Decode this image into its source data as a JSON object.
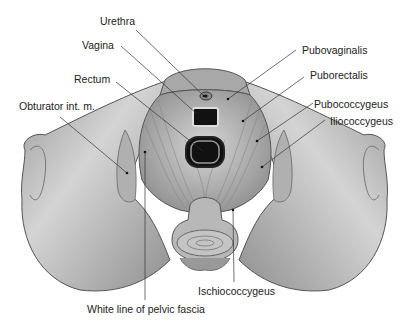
{
  "figure": {
    "labels": {
      "urethra": "Urethra",
      "vagina": "Vagina",
      "rectum": "Rectum",
      "obturator": "Obturator int. m.",
      "pubovaginalis": "Pubovaginalis",
      "puborectalis": "Puborectalis",
      "pubococcygeus": "Pubococcygeus",
      "iliococcygeus": "Iliococcygeus",
      "ischiococcygeus": "Ischiococcygeus",
      "white_line": "White line of pelvic fascia"
    },
    "colors": {
      "bone": "#c8c8c8",
      "bone_shadow": "#8a8a8a",
      "muscle": "#b5b5b5",
      "lumen": "#111111",
      "leader": "#333333"
    }
  }
}
